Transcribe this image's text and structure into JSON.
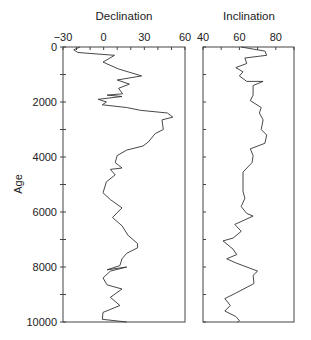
{
  "chart_data": [
    {
      "type": "line",
      "title": "Declination",
      "xlabel": "",
      "ylabel": "Age",
      "xlim": [
        -30,
        60
      ],
      "ylim": [
        10000,
        0
      ],
      "x_ticks": [
        -30,
        0,
        30,
        60
      ],
      "x_minor_step": 10,
      "y_ticks": [
        0,
        2000,
        4000,
        6000,
        8000,
        10000
      ],
      "y_minor_step": 1000,
      "grid": false,
      "series": [
        {
          "name": "Declination",
          "points": [
            [
              0,
              -17.5
            ],
            [
              100,
              -22
            ],
            [
              200,
              -19
            ],
            [
              300,
              8
            ],
            [
              550,
              -0.5
            ],
            [
              800,
              11
            ],
            [
              1050,
              28
            ],
            [
              1200,
              10
            ],
            [
              1350,
              19
            ],
            [
              1500,
              11
            ],
            [
              1700,
              14
            ],
            [
              1750,
              2.5
            ],
            [
              1800,
              13.5
            ],
            [
              1900,
              -4
            ],
            [
              2000,
              2
            ],
            [
              2100,
              -1
            ],
            [
              2200,
              17
            ],
            [
              2300,
              27
            ],
            [
              2400,
              47
            ],
            [
              2550,
              51
            ],
            [
              2650,
              43
            ],
            [
              3000,
              44
            ],
            [
              3150,
              38
            ],
            [
              3450,
              33
            ],
            [
              3600,
              29
            ],
            [
              3750,
              17
            ],
            [
              3950,
              10
            ],
            [
              4200,
              8.5
            ],
            [
              4400,
              13.5
            ],
            [
              4450,
              5
            ],
            [
              4650,
              8.5
            ],
            [
              4900,
              2
            ],
            [
              5300,
              -0.5
            ],
            [
              5550,
              5
            ],
            [
              5850,
              13.5
            ],
            [
              6000,
              10.5
            ],
            [
              6200,
              6.5
            ],
            [
              6500,
              13.5
            ],
            [
              6850,
              18
            ],
            [
              7150,
              25
            ],
            [
              7300,
              25
            ],
            [
              7500,
              17
            ],
            [
              7700,
              13.5
            ],
            [
              7950,
              12
            ],
            [
              8100,
              2.5
            ],
            [
              8000,
              17
            ],
            [
              8150,
              5
            ],
            [
              8400,
              -0.5
            ],
            [
              8650,
              2.5
            ],
            [
              8800,
              13.5
            ],
            [
              9100,
              5
            ],
            [
              9400,
              12
            ],
            [
              9650,
              -0.5
            ],
            [
              9900,
              -1
            ],
            [
              10000,
              17
            ]
          ]
        }
      ]
    },
    {
      "type": "line",
      "title": "Inclination",
      "xlabel": "",
      "ylabel": "",
      "xlim": [
        40,
        90
      ],
      "ylim": [
        10000,
        0
      ],
      "x_ticks": [
        40,
        60,
        80
      ],
      "x_minor_step": 10,
      "y_ticks": [
        0,
        2000,
        4000,
        6000,
        8000,
        10000
      ],
      "y_minor_step": 1000,
      "grid": false,
      "series": [
        {
          "name": "Inclination",
          "points": [
            [
              0,
              61
            ],
            [
              150,
              74
            ],
            [
              300,
              75
            ],
            [
              400,
              63
            ],
            [
              600,
              64
            ],
            [
              750,
              58
            ],
            [
              900,
              62
            ],
            [
              1050,
              60
            ],
            [
              1250,
              64
            ],
            [
              1250,
              73
            ],
            [
              1400,
              67.5
            ],
            [
              1750,
              67.5
            ],
            [
              1950,
              66
            ],
            [
              2200,
              72
            ],
            [
              2400,
              71
            ],
            [
              2650,
              73
            ],
            [
              3000,
              72
            ],
            [
              3200,
              75
            ],
            [
              3500,
              74
            ],
            [
              3700,
              66
            ],
            [
              3950,
              67.5
            ],
            [
              4200,
              67
            ],
            [
              4550,
              62
            ],
            [
              4950,
              62
            ],
            [
              5250,
              62
            ],
            [
              5500,
              63
            ],
            [
              5800,
              61
            ],
            [
              6050,
              64
            ],
            [
              6150,
              67.5
            ],
            [
              6450,
              57.5
            ],
            [
              6700,
              61
            ],
            [
              6950,
              56.5
            ],
            [
              7050,
              51
            ],
            [
              7350,
              56.5
            ],
            [
              7550,
              58.5
            ],
            [
              7700,
              53
            ],
            [
              7850,
              58
            ],
            [
              8150,
              70
            ],
            [
              8300,
              67.5
            ],
            [
              8600,
              68
            ],
            [
              8950,
              58
            ],
            [
              9150,
              52
            ],
            [
              9400,
              55
            ],
            [
              9600,
              52
            ],
            [
              9800,
              58
            ],
            [
              9950,
              60
            ],
            [
              10000,
              59
            ]
          ]
        }
      ]
    }
  ],
  "axes_labels": {
    "y_label": "Age",
    "left_title": "Declination",
    "right_title": "Inclination"
  },
  "colors": {
    "line": "#333333",
    "axis": "#444444",
    "text": "#222222"
  }
}
